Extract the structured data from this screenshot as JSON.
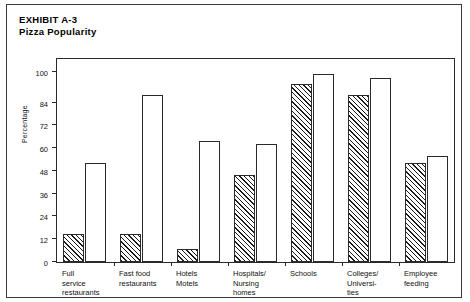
{
  "exhibit": {
    "label": "EXHIBIT A-3",
    "subtitle": "Pizza Popularity"
  },
  "chart_data": {
    "type": "bar",
    "title": "Pizza Popularity",
    "subtitle": "EXHIBIT A-3",
    "xlabel": "",
    "ylabel": "Percentage",
    "ylim": [
      0,
      108
    ],
    "yticks": [
      0,
      12,
      24,
      36,
      48,
      60,
      72,
      84,
      100
    ],
    "ytick_labels": [
      "0",
      "12",
      "24",
      "36",
      "48",
      "60",
      "72",
      "84",
      "100"
    ],
    "grid": false,
    "legend": "none",
    "categories": [
      "Full service restaurants",
      "Fast food restaurants",
      "Hotels Motels",
      "Hospitals/ Nursing homes",
      "Schools",
      "Colleges/ Universities",
      "Employee feeding"
    ],
    "category_lines": [
      [
        "Full",
        "service",
        "restaurants"
      ],
      [
        "Fast food",
        "restaurants"
      ],
      [
        "Hotels",
        "Motels"
      ],
      [
        "Hospitals/",
        "Nursing",
        "homes"
      ],
      [
        "Schools"
      ],
      [
        "Colleges/",
        "Universi-",
        "ties"
      ],
      [
        "Employee",
        "feeding"
      ]
    ],
    "series": [
      {
        "name": "hatched",
        "style": "diagonal-hatch",
        "values": [
          15,
          15,
          7,
          46,
          94,
          88,
          52
        ]
      },
      {
        "name": "open",
        "style": "white-outline",
        "values": [
          52,
          88,
          64,
          62,
          99,
          97,
          56
        ]
      }
    ]
  },
  "colors": {
    "bar_outline": "#2a2a2a",
    "hatch": "#1a1a1a",
    "open_fill": "#ffffff",
    "frame": "#3a3a3a",
    "text": "#111111"
  }
}
